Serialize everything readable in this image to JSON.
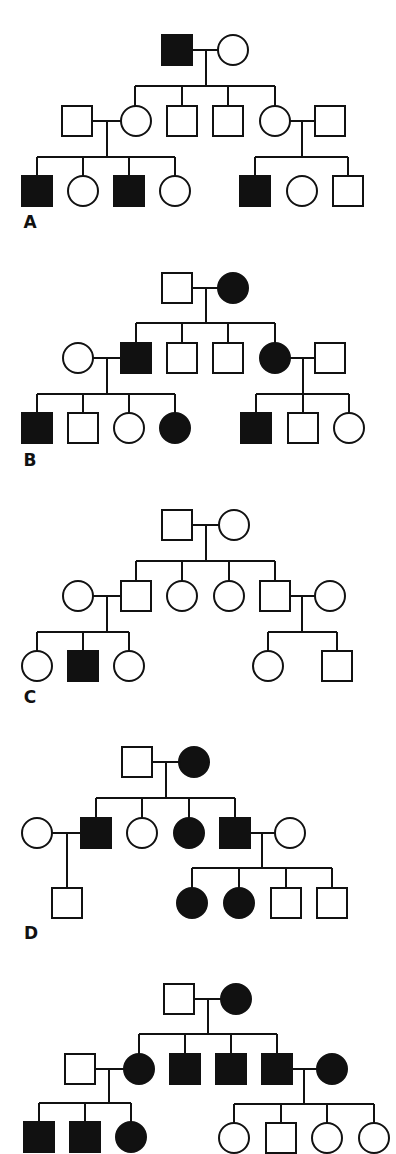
{
  "figure": {
    "colors": {
      "affected": "#111111",
      "unaffected": "#ffffff",
      "stroke": "#111111"
    },
    "legend": {
      "square": "male",
      "circle": "female",
      "filled": "affected",
      "open": "unaffected"
    }
  },
  "pedigrees": [
    {
      "label": "A",
      "label_pos": [
        30,
        228
      ],
      "individuals": [
        {
          "id": "A-I1",
          "sex": "male",
          "affected": true,
          "x": 177,
          "y": 50
        },
        {
          "id": "A-I2",
          "sex": "female",
          "affected": false,
          "x": 233,
          "y": 50
        },
        {
          "id": "A-II1",
          "sex": "male",
          "affected": false,
          "x": 77,
          "y": 121
        },
        {
          "id": "A-II2",
          "sex": "female",
          "affected": false,
          "x": 136,
          "y": 121
        },
        {
          "id": "A-II3",
          "sex": "male",
          "affected": false,
          "x": 182,
          "y": 121
        },
        {
          "id": "A-II4",
          "sex": "male",
          "affected": false,
          "x": 228,
          "y": 121
        },
        {
          "id": "A-II5",
          "sex": "female",
          "affected": false,
          "x": 275,
          "y": 121
        },
        {
          "id": "A-II6",
          "sex": "male",
          "affected": false,
          "x": 330,
          "y": 121
        },
        {
          "id": "A-III1",
          "sex": "male",
          "affected": true,
          "x": 37,
          "y": 191
        },
        {
          "id": "A-III2",
          "sex": "female",
          "affected": false,
          "x": 83,
          "y": 191
        },
        {
          "id": "A-III3",
          "sex": "male",
          "affected": true,
          "x": 129,
          "y": 191
        },
        {
          "id": "A-III4",
          "sex": "female",
          "affected": false,
          "x": 175,
          "y": 191
        },
        {
          "id": "A-III5",
          "sex": "male",
          "affected": true,
          "x": 255,
          "y": 191
        },
        {
          "id": "A-III6",
          "sex": "female",
          "affected": false,
          "x": 302,
          "y": 191
        },
        {
          "id": "A-III7",
          "sex": "male",
          "affected": false,
          "x": 348,
          "y": 191
        }
      ],
      "lines": [
        [
          192,
          50,
          218,
          50
        ],
        [
          206,
          50,
          206,
          86
        ],
        [
          135,
          86,
          275,
          86
        ],
        [
          135,
          86,
          135,
          106
        ],
        [
          182,
          86,
          182,
          106
        ],
        [
          228,
          86,
          228,
          106
        ],
        [
          275,
          86,
          275,
          106
        ],
        [
          92,
          121,
          121,
          121
        ],
        [
          107,
          121,
          107,
          157
        ],
        [
          37,
          157,
          175,
          157
        ],
        [
          37,
          157,
          37,
          176
        ],
        [
          83,
          157,
          83,
          176
        ],
        [
          129,
          157,
          129,
          176
        ],
        [
          175,
          157,
          175,
          176
        ],
        [
          290,
          121,
          315,
          121
        ],
        [
          302,
          121,
          302,
          157
        ],
        [
          255,
          157,
          348,
          157
        ],
        [
          255,
          157,
          255,
          176
        ],
        [
          348,
          157,
          348,
          176
        ]
      ]
    },
    {
      "label": "B",
      "label_pos": [
        30,
        466
      ],
      "individuals": [
        {
          "id": "B-I1",
          "sex": "male",
          "affected": false,
          "x": 177,
          "y": 288
        },
        {
          "id": "B-I2",
          "sex": "female",
          "affected": true,
          "x": 233,
          "y": 288
        },
        {
          "id": "B-II1",
          "sex": "female",
          "affected": false,
          "x": 78,
          "y": 358
        },
        {
          "id": "B-II2",
          "sex": "male",
          "affected": true,
          "x": 136,
          "y": 358
        },
        {
          "id": "B-II3",
          "sex": "male",
          "affected": false,
          "x": 182,
          "y": 358
        },
        {
          "id": "B-II4",
          "sex": "male",
          "affected": false,
          "x": 228,
          "y": 358
        },
        {
          "id": "B-II5",
          "sex": "female",
          "affected": true,
          "x": 275,
          "y": 358
        },
        {
          "id": "B-II6",
          "sex": "male",
          "affected": false,
          "x": 330,
          "y": 358
        },
        {
          "id": "B-III1",
          "sex": "male",
          "affected": true,
          "x": 37,
          "y": 428
        },
        {
          "id": "B-III2",
          "sex": "male",
          "affected": false,
          "x": 83,
          "y": 428
        },
        {
          "id": "B-III3",
          "sex": "female",
          "affected": false,
          "x": 129,
          "y": 428
        },
        {
          "id": "B-III4",
          "sex": "female",
          "affected": true,
          "x": 175,
          "y": 428
        },
        {
          "id": "B-III5",
          "sex": "male",
          "affected": true,
          "x": 256,
          "y": 428
        },
        {
          "id": "B-III6",
          "sex": "male",
          "affected": false,
          "x": 303,
          "y": 428
        },
        {
          "id": "B-III7",
          "sex": "female",
          "affected": false,
          "x": 349,
          "y": 428
        }
      ],
      "lines": [
        [
          192,
          288,
          218,
          288
        ],
        [
          206,
          288,
          206,
          323
        ],
        [
          136,
          323,
          275,
          323
        ],
        [
          136,
          323,
          136,
          343
        ],
        [
          182,
          323,
          182,
          343
        ],
        [
          228,
          323,
          228,
          343
        ],
        [
          275,
          323,
          275,
          343
        ],
        [
          93,
          358,
          121,
          358
        ],
        [
          107,
          358,
          107,
          394
        ],
        [
          37,
          394,
          175,
          394
        ],
        [
          37,
          394,
          37,
          413
        ],
        [
          83,
          394,
          83,
          413
        ],
        [
          129,
          394,
          129,
          413
        ],
        [
          175,
          394,
          175,
          413
        ],
        [
          290,
          358,
          315,
          358
        ],
        [
          303,
          358,
          303,
          394
        ],
        [
          256,
          394,
          349,
          394
        ],
        [
          256,
          394,
          256,
          413
        ],
        [
          303,
          394,
          303,
          413
        ],
        [
          349,
          394,
          349,
          413
        ]
      ]
    },
    {
      "label": "C",
      "label_pos": [
        30,
        703
      ],
      "individuals": [
        {
          "id": "C-I1",
          "sex": "male",
          "affected": false,
          "x": 177,
          "y": 525
        },
        {
          "id": "C-I2",
          "sex": "female",
          "affected": false,
          "x": 234,
          "y": 525
        },
        {
          "id": "C-II1",
          "sex": "female",
          "affected": false,
          "x": 78,
          "y": 596
        },
        {
          "id": "C-II2",
          "sex": "male",
          "affected": false,
          "x": 136,
          "y": 596
        },
        {
          "id": "C-II3",
          "sex": "female",
          "affected": false,
          "x": 182,
          "y": 596
        },
        {
          "id": "C-II4",
          "sex": "female",
          "affected": false,
          "x": 229,
          "y": 596
        },
        {
          "id": "C-II5",
          "sex": "male",
          "affected": false,
          "x": 275,
          "y": 596
        },
        {
          "id": "C-II6",
          "sex": "female",
          "affected": false,
          "x": 330,
          "y": 596
        },
        {
          "id": "C-III1",
          "sex": "female",
          "affected": false,
          "x": 37,
          "y": 666
        },
        {
          "id": "C-III2",
          "sex": "male",
          "affected": true,
          "x": 83,
          "y": 666
        },
        {
          "id": "C-III3",
          "sex": "female",
          "affected": false,
          "x": 129,
          "y": 666
        },
        {
          "id": "C-III4",
          "sex": "female",
          "affected": false,
          "x": 268,
          "y": 666
        },
        {
          "id": "C-III5",
          "sex": "male",
          "affected": false,
          "x": 337,
          "y": 666
        }
      ],
      "lines": [
        [
          192,
          525,
          219,
          525
        ],
        [
          206,
          525,
          206,
          561
        ],
        [
          136,
          561,
          275,
          561
        ],
        [
          136,
          561,
          136,
          581
        ],
        [
          182,
          561,
          182,
          581
        ],
        [
          229,
          561,
          229,
          581
        ],
        [
          275,
          561,
          275,
          581
        ],
        [
          93,
          596,
          121,
          596
        ],
        [
          107,
          596,
          107,
          632
        ],
        [
          37,
          632,
          129,
          632
        ],
        [
          37,
          632,
          37,
          651
        ],
        [
          83,
          632,
          83,
          651
        ],
        [
          129,
          632,
          129,
          651
        ],
        [
          290,
          596,
          315,
          596
        ],
        [
          302,
          596,
          302,
          632
        ],
        [
          268,
          632,
          337,
          632
        ],
        [
          268,
          632,
          268,
          651
        ],
        [
          337,
          632,
          337,
          651
        ]
      ]
    },
    {
      "label": "D",
      "label_pos": [
        31,
        939
      ],
      "individuals": [
        {
          "id": "D-I1",
          "sex": "male",
          "affected": false,
          "x": 137,
          "y": 762
        },
        {
          "id": "D-I2",
          "sex": "female",
          "affected": true,
          "x": 194,
          "y": 762
        },
        {
          "id": "D-II1",
          "sex": "female",
          "affected": false,
          "x": 37,
          "y": 833
        },
        {
          "id": "D-II2",
          "sex": "male",
          "affected": true,
          "x": 96,
          "y": 833
        },
        {
          "id": "D-II3",
          "sex": "female",
          "affected": false,
          "x": 142,
          "y": 833
        },
        {
          "id": "D-II4",
          "sex": "female",
          "affected": true,
          "x": 189,
          "y": 833
        },
        {
          "id": "D-II5",
          "sex": "male",
          "affected": true,
          "x": 235,
          "y": 833
        },
        {
          "id": "D-II6",
          "sex": "female",
          "affected": false,
          "x": 290,
          "y": 833
        },
        {
          "id": "D-III1",
          "sex": "male",
          "affected": false,
          "x": 67,
          "y": 903
        },
        {
          "id": "D-III2",
          "sex": "female",
          "affected": true,
          "x": 192,
          "y": 903
        },
        {
          "id": "D-III3",
          "sex": "female",
          "affected": true,
          "x": 239,
          "y": 903
        },
        {
          "id": "D-III4",
          "sex": "male",
          "affected": false,
          "x": 286,
          "y": 903
        },
        {
          "id": "D-III5",
          "sex": "male",
          "affected": false,
          "x": 332,
          "y": 903
        }
      ],
      "lines": [
        [
          152,
          762,
          179,
          762
        ],
        [
          166,
          762,
          166,
          798
        ],
        [
          96,
          798,
          235,
          798
        ],
        [
          96,
          798,
          96,
          818
        ],
        [
          142,
          798,
          142,
          818
        ],
        [
          189,
          798,
          189,
          818
        ],
        [
          235,
          798,
          235,
          818
        ],
        [
          52,
          833,
          81,
          833
        ],
        [
          67,
          833,
          67,
          888
        ],
        [
          250,
          833,
          275,
          833
        ],
        [
          262,
          833,
          262,
          868
        ],
        [
          192,
          868,
          332,
          868
        ],
        [
          192,
          868,
          192,
          888
        ],
        [
          239,
          868,
          239,
          888
        ],
        [
          286,
          868,
          286,
          888
        ],
        [
          332,
          868,
          332,
          888
        ]
      ]
    },
    {
      "label": "E",
      "label_pos": null,
      "individuals": [
        {
          "id": "E-I1",
          "sex": "male",
          "affected": false,
          "x": 179,
          "y": 999
        },
        {
          "id": "E-I2",
          "sex": "female",
          "affected": true,
          "x": 236,
          "y": 999
        },
        {
          "id": "E-II1",
          "sex": "male",
          "affected": false,
          "x": 80,
          "y": 1069
        },
        {
          "id": "E-II2",
          "sex": "female",
          "affected": true,
          "x": 139,
          "y": 1069
        },
        {
          "id": "E-II3",
          "sex": "male",
          "affected": true,
          "x": 185,
          "y": 1069
        },
        {
          "id": "E-II4",
          "sex": "male",
          "affected": true,
          "x": 231,
          "y": 1069
        },
        {
          "id": "E-II5",
          "sex": "male",
          "affected": true,
          "x": 277,
          "y": 1069
        },
        {
          "id": "E-II6",
          "sex": "female",
          "affected": true,
          "x": 332,
          "y": 1069
        },
        {
          "id": "E-III1",
          "sex": "male",
          "affected": true,
          "x": 39,
          "y": 1137
        },
        {
          "id": "E-III2",
          "sex": "male",
          "affected": true,
          "x": 85,
          "y": 1137
        },
        {
          "id": "E-III3",
          "sex": "female",
          "affected": true,
          "x": 131,
          "y": 1137
        },
        {
          "id": "E-III4",
          "sex": "female",
          "affected": false,
          "x": 234,
          "y": 1138
        },
        {
          "id": "E-III5",
          "sex": "male",
          "affected": false,
          "x": 281,
          "y": 1138
        },
        {
          "id": "E-III6",
          "sex": "female",
          "affected": false,
          "x": 327,
          "y": 1138
        },
        {
          "id": "E-III7",
          "sex": "female",
          "affected": false,
          "x": 374,
          "y": 1138
        }
      ],
      "lines": [
        [
          194,
          999,
          221,
          999
        ],
        [
          208,
          999,
          208,
          1034
        ],
        [
          139,
          1034,
          277,
          1034
        ],
        [
          139,
          1034,
          139,
          1054
        ],
        [
          185,
          1034,
          185,
          1054
        ],
        [
          231,
          1034,
          231,
          1054
        ],
        [
          277,
          1034,
          277,
          1054
        ],
        [
          95,
          1069,
          124,
          1069
        ],
        [
          109,
          1069,
          109,
          1103
        ],
        [
          39,
          1103,
          131,
          1103
        ],
        [
          39,
          1103,
          39,
          1122
        ],
        [
          85,
          1103,
          85,
          1122
        ],
        [
          131,
          1103,
          131,
          1122
        ],
        [
          292,
          1069,
          317,
          1069
        ],
        [
          304,
          1069,
          304,
          1104
        ],
        [
          234,
          1104,
          374,
          1104
        ],
        [
          234,
          1104,
          234,
          1123
        ],
        [
          281,
          1104,
          281,
          1123
        ],
        [
          327,
          1104,
          327,
          1123
        ],
        [
          374,
          1104,
          374,
          1123
        ]
      ]
    }
  ],
  "symbol_size": {
    "square_side": 30,
    "circle_radius": 15
  }
}
